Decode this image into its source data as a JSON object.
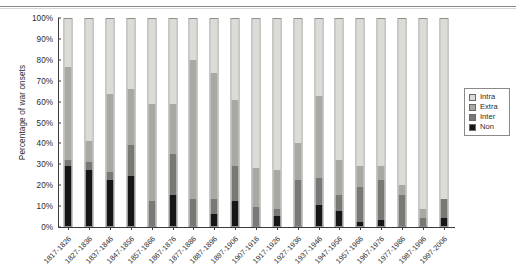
{
  "chart_data": {
    "type": "bar",
    "stacked": true,
    "title": "",
    "xlabel": "",
    "ylabel": "Percentage of war onsets",
    "ylim": [
      0,
      100
    ],
    "ytick_labels": [
      "0%",
      "10%",
      "20%",
      "30%",
      "40%",
      "50%",
      "60%",
      "70%",
      "80%",
      "90%",
      "100%"
    ],
    "ytick_values": [
      0,
      10,
      20,
      30,
      40,
      50,
      60,
      70,
      80,
      90,
      100
    ],
    "grid": false,
    "legend_position": "right",
    "categories": [
      "1817-1826",
      "1827-1836",
      "1837-1846",
      "1847-1856",
      "1857-1866",
      "1867-1876",
      "1877-1886",
      "1887-1896",
      "1897-1906",
      "1907-1916",
      "1917-1926",
      "1927-1936",
      "1937-1946",
      "1947-1956",
      "1957-1966",
      "1967-1976",
      "1977-1986",
      "1987-1996",
      "1997-2006"
    ],
    "series": [
      {
        "name": "Non",
        "color": "#161616",
        "values": [
          29,
          27,
          22,
          24,
          0,
          15,
          0,
          6,
          12,
          0,
          5,
          0,
          10,
          7,
          2,
          3,
          0,
          0,
          4
        ]
      },
      {
        "name": "Inter",
        "color": "#787874",
        "values": [
          3,
          4,
          4,
          15,
          12,
          20,
          13,
          7,
          17,
          9,
          3,
          22,
          13,
          8,
          17,
          19,
          15,
          4,
          9
        ]
      },
      {
        "name": "Extra",
        "color": "#a9a9a3",
        "values": [
          45,
          10,
          38,
          27,
          47,
          24,
          67,
          61,
          32,
          19,
          19,
          18,
          40,
          17,
          10,
          7,
          5,
          4,
          0
        ]
      },
      {
        "name": "Intra",
        "color": "#dcdcd6",
        "values": [
          23,
          59,
          36,
          34,
          41,
          41,
          20,
          26,
          39,
          72,
          73,
          60,
          37,
          68,
          71,
          71,
          80,
          92,
          87
        ]
      }
    ],
    "legend_entries": [
      "Intra",
      "Extra",
      "Inter",
      "Non"
    ],
    "legend_colors": [
      "#dcdcd6",
      "#a9a9a3",
      "#787874",
      "#161616"
    ]
  }
}
